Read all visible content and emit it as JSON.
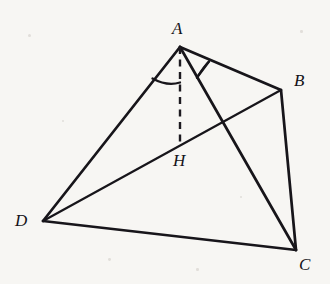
{
  "figure": {
    "background_color": "#f7f6f3",
    "ink_color": "#17151a",
    "width": 330,
    "height": 284,
    "labels": [
      {
        "id": "A",
        "text": "A",
        "x": 172,
        "y": 20
      },
      {
        "id": "B",
        "text": "B",
        "x": 294,
        "y": 72
      },
      {
        "id": "C",
        "text": "C",
        "x": 299,
        "y": 256
      },
      {
        "id": "D",
        "text": "D",
        "x": 15,
        "y": 212
      },
      {
        "id": "H",
        "text": "H",
        "x": 173,
        "y": 152
      }
    ],
    "vertices": {
      "A": {
        "x": 180,
        "y": 47
      },
      "B": {
        "x": 281,
        "y": 90
      },
      "C": {
        "x": 296,
        "y": 250
      },
      "D": {
        "x": 43,
        "y": 221
      },
      "H": {
        "x": 180,
        "y": 143
      }
    },
    "edges": [
      {
        "id": "AB",
        "from": "A",
        "to": "B",
        "style": "solid"
      },
      {
        "id": "AD",
        "from": "A",
        "to": "D",
        "style": "solid"
      },
      {
        "id": "AC",
        "from": "A",
        "to": "C",
        "style": "solid"
      },
      {
        "id": "BC",
        "from": "B",
        "to": "C",
        "style": "solid"
      },
      {
        "id": "DC",
        "from": "D",
        "to": "C",
        "style": "solid"
      },
      {
        "id": "DB",
        "from": "D",
        "to": "B",
        "style": "solid"
      },
      {
        "id": "AH",
        "from": "A",
        "to": "H",
        "style": "dashed"
      }
    ],
    "angle_marks": [
      {
        "id": "angle-DAH",
        "at": "A",
        "between": [
          "AD",
          "AH"
        ],
        "radius": 35
      },
      {
        "id": "angle-CAB",
        "at": "A",
        "between": [
          "AC",
          "AB"
        ],
        "radius": 31
      }
    ],
    "specks": [
      {
        "x": 28,
        "y": 34,
        "r": 1.6
      },
      {
        "x": 300,
        "y": 30,
        "r": 1.3
      },
      {
        "x": 108,
        "y": 258,
        "r": 1.4
      },
      {
        "x": 240,
        "y": 196,
        "r": 1.2
      },
      {
        "x": 62,
        "y": 120,
        "r": 1.1
      },
      {
        "x": 196,
        "y": 268,
        "r": 1.3
      }
    ]
  }
}
